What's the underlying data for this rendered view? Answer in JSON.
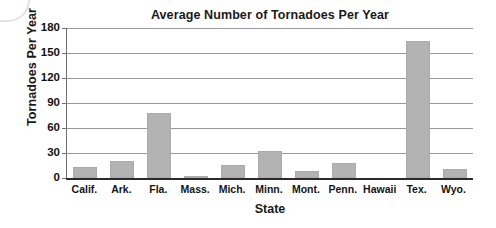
{
  "chart_data": {
    "type": "bar",
    "title": "Average Number of Tornadoes Per Year",
    "xlabel": "State",
    "ylabel": "Tornadoes Per Year",
    "categories": [
      "Calif.",
      "Ark.",
      "Fla.",
      "Mass.",
      "Mich.",
      "Minn.",
      "Mont.",
      "Penn.",
      "Hawaii",
      "Tex.",
      "Wyo."
    ],
    "values": [
      13,
      21,
      78,
      2,
      16,
      32,
      9,
      18,
      0,
      165,
      11
    ],
    "ylim": [
      0,
      180
    ],
    "yticks": [
      0,
      30,
      60,
      90,
      120,
      150,
      180
    ],
    "ytick_labels": [
      "0",
      "30",
      "60",
      "90",
      "120",
      "150",
      "180"
    ],
    "grid": "horizontal",
    "legend": "none",
    "bar_color": "#b3b3b3",
    "axis_color": "#2b2b2b",
    "gridline_color": "#9a9a9a",
    "text_color": "#1a1a1a"
  }
}
